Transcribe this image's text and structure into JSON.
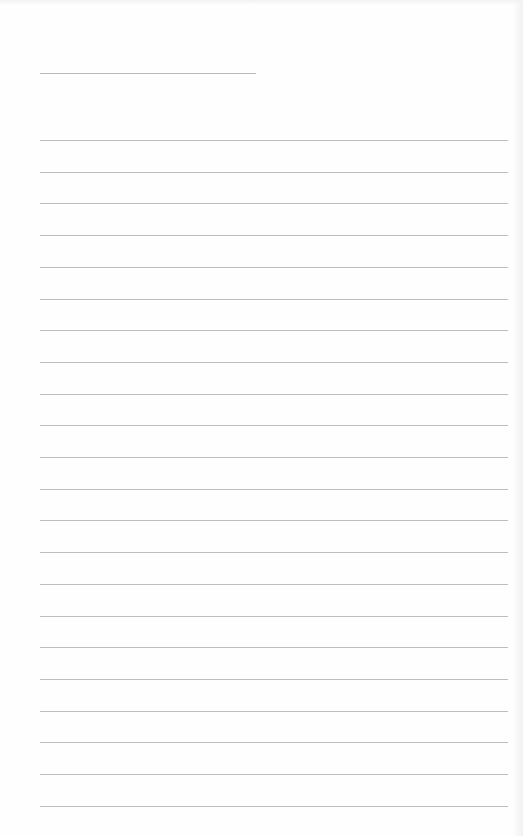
{
  "document": {
    "type": "lined writing sheet",
    "title_line": {
      "x": 40,
      "y": 73,
      "width": 216
    },
    "ruled_lines": {
      "count": 22,
      "x": 40,
      "width": 468,
      "first_y": 140,
      "spacing": 31.7,
      "color": "#bdbdbd"
    },
    "text_content": ""
  }
}
